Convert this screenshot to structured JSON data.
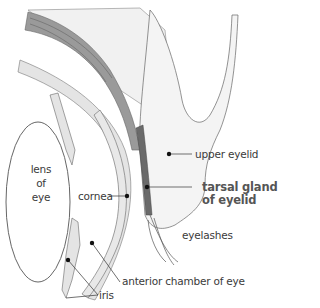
{
  "figure": {
    "colors": {
      "background": "#ffffff",
      "line": "#555555",
      "tissue_fill": "#e4e4e4",
      "dark_gland": "#6a6a6a",
      "label_text": "#3a3a3a",
      "highlight_label": "#555555",
      "pointer_dot": "#111111"
    }
  },
  "labels": {
    "lens": {
      "line1": "lens",
      "line2": "of",
      "line3": "eye"
    },
    "cornea": "cornea",
    "upper_eyelid": "upper eyelid",
    "tarsal_gland": {
      "line1": "tarsal gland",
      "line2": "of eyelid"
    },
    "eyelashes": "eyelashes",
    "anterior_chamber": "anterior chamber of eye",
    "iris": "iris"
  }
}
